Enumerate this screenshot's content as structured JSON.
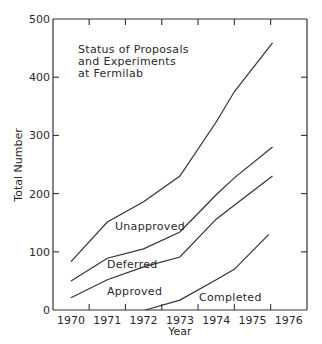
{
  "chart_data": {
    "type": "line",
    "title": "Status of Proposals and Experiments at Fermilab",
    "title_lines": [
      "Status of Proposals",
      "and Experiments",
      "at Fermilab"
    ],
    "xlabel": "Year",
    "ylabel": "Total Number",
    "xlim": [
      1970,
      1976
    ],
    "ylim": [
      0,
      500
    ],
    "x_ticks": [
      "1970",
      "1971",
      "1972",
      "1973",
      "1974",
      "1975",
      "1976"
    ],
    "y_ticks": [
      "0",
      "100",
      "200",
      "300",
      "400",
      "500"
    ],
    "grid": false,
    "legend": "inline labels",
    "series": [
      {
        "name": "Unapproved",
        "x": [
          1970,
          1971,
          1972,
          1973,
          1974,
          1974.5,
          1975.55
        ],
        "values": [
          83,
          151,
          186,
          230,
          323,
          375,
          459
        ]
      },
      {
        "name": "Deferred",
        "x": [
          1970,
          1971,
          1972,
          1973,
          1974,
          1974.5,
          1975.55
        ],
        "values": [
          50,
          89,
          105,
          134,
          198,
          227,
          280
        ]
      },
      {
        "name": "Approved",
        "x": [
          1970,
          1971,
          1972,
          1973,
          1974,
          1974.5,
          1975.55
        ],
        "values": [
          21,
          52,
          74,
          91,
          156,
          180,
          230
        ]
      },
      {
        "name": "Completed",
        "x": [
          1972.05,
          1973,
          1974,
          1974.5,
          1975.45
        ],
        "values": [
          0,
          17,
          52,
          70,
          130
        ]
      }
    ]
  }
}
